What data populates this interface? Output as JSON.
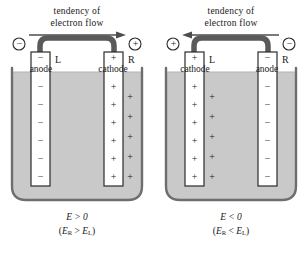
{
  "figure": {
    "colors": {
      "ink": "#1a1a1a",
      "wire": "#5a5a5a",
      "solution": "#c9c9c9",
      "electrode_fill": "#ffffff",
      "beaker_wall": "#8a8a8a",
      "arrow": "#4d4d4d"
    }
  },
  "cells": [
    {
      "id": "left-cell",
      "heading_line1": "tendency of",
      "heading_line2": "electron flow",
      "arrow_direction": "right",
      "terminal_left_sign": "−",
      "terminal_right_sign": "+",
      "electrode_left": {
        "sign": "−",
        "tag": "L",
        "name": "anode",
        "ion_sign": "−",
        "ion_count": 6
      },
      "electrode_right": {
        "sign": "+",
        "tag": "R",
        "name": "cathode",
        "ion_sign": "+",
        "ion_count": 6
      },
      "solution_ion_sign": "+",
      "solution_ion_count": 5,
      "result_main": "E > 0",
      "result_sub_open": "(",
      "result_sub_a": "E",
      "result_sub_a_sub": "R",
      "result_sub_op": " > ",
      "result_sub_b": "E",
      "result_sub_b_sub": "L",
      "result_sub_close": ")"
    },
    {
      "id": "right-cell",
      "heading_line1": "tendency of",
      "heading_line2": "electron flow",
      "arrow_direction": "left",
      "terminal_left_sign": "+",
      "terminal_right_sign": "−",
      "electrode_left": {
        "sign": "+",
        "tag": "L",
        "name": "cathode",
        "ion_sign": "+",
        "ion_count": 6
      },
      "electrode_right": {
        "sign": "−",
        "tag": "R",
        "name": "anode",
        "ion_sign": "−",
        "ion_count": 6
      },
      "solution_ion_sign": "+",
      "solution_ion_count": 5,
      "result_main": "E < 0",
      "result_sub_open": "(",
      "result_sub_a": "E",
      "result_sub_a_sub": "R",
      "result_sub_op": " < ",
      "result_sub_b": "E",
      "result_sub_b_sub": "L",
      "result_sub_close": ")"
    }
  ]
}
